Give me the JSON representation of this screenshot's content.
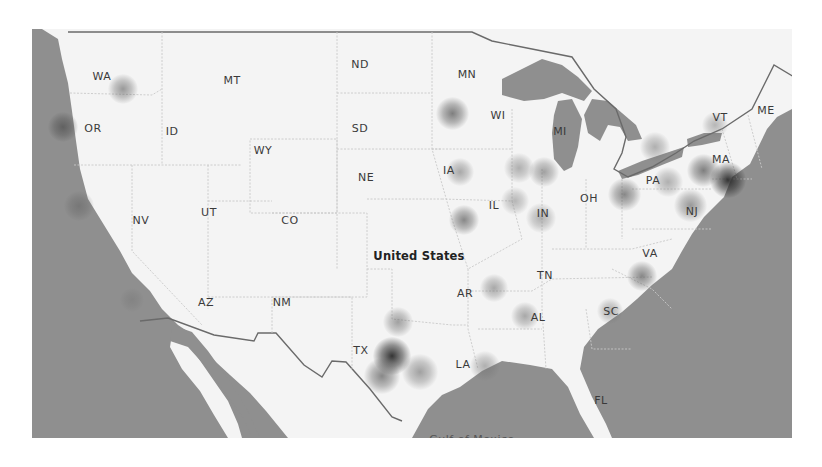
{
  "map": {
    "country_label": "United States",
    "sea_label": "Gulf of Mexico",
    "colors": {
      "water": "#8f8f8f",
      "land": "#f4f4f4",
      "border": "#6a6a6a",
      "state_line": "#c8c8c8",
      "heat_strong": "#2a2a2a",
      "heat_weak": "#9a9a9a"
    },
    "state_labels": [
      {
        "code": "WA",
        "x": 102,
        "y": 76
      },
      {
        "code": "OR",
        "x": 93,
        "y": 128
      },
      {
        "code": "ID",
        "x": 172,
        "y": 131
      },
      {
        "code": "MT",
        "x": 232,
        "y": 80
      },
      {
        "code": "WY",
        "x": 263,
        "y": 150
      },
      {
        "code": "ND",
        "x": 360,
        "y": 64
      },
      {
        "code": "SD",
        "x": 360,
        "y": 128
      },
      {
        "code": "NE",
        "x": 366,
        "y": 177
      },
      {
        "code": "NV",
        "x": 141,
        "y": 220
      },
      {
        "code": "UT",
        "x": 209,
        "y": 212
      },
      {
        "code": "CO",
        "x": 290,
        "y": 220
      },
      {
        "code": "AZ",
        "x": 206,
        "y": 302
      },
      {
        "code": "NM",
        "x": 282,
        "y": 302
      },
      {
        "code": "TX",
        "x": 361,
        "y": 350
      },
      {
        "code": "MN",
        "x": 467,
        "y": 74
      },
      {
        "code": "WI",
        "x": 498,
        "y": 115
      },
      {
        "code": "IA",
        "x": 449,
        "y": 170
      },
      {
        "code": "IL",
        "x": 494,
        "y": 205
      },
      {
        "code": "IN",
        "x": 543,
        "y": 213
      },
      {
        "code": "MI",
        "x": 560,
        "y": 131
      },
      {
        "code": "OH",
        "x": 589,
        "y": 198
      },
      {
        "code": "PA",
        "x": 653,
        "y": 180
      },
      {
        "code": "NJ",
        "x": 692,
        "y": 211
      },
      {
        "code": "VT",
        "x": 720,
        "y": 117
      },
      {
        "code": "ME",
        "x": 766,
        "y": 110
      },
      {
        "code": "MA",
        "x": 721,
        "y": 159
      },
      {
        "code": "VA",
        "x": 650,
        "y": 253
      },
      {
        "code": "TN",
        "x": 545,
        "y": 275
      },
      {
        "code": "AR",
        "x": 465,
        "y": 293
      },
      {
        "code": "AL",
        "x": 538,
        "y": 317
      },
      {
        "code": "SC",
        "x": 611,
        "y": 311
      },
      {
        "code": "LA",
        "x": 463,
        "y": 364
      },
      {
        "code": "FL",
        "x": 601,
        "y": 400
      }
    ],
    "heat_points": [
      {
        "name": "spokane",
        "x": 123,
        "y": 89,
        "r": 14,
        "intensity": 0.45
      },
      {
        "name": "portland",
        "x": 63,
        "y": 127,
        "r": 14,
        "intensity": 0.6
      },
      {
        "name": "sacramento",
        "x": 79,
        "y": 206,
        "r": 14,
        "intensity": 0.4
      },
      {
        "name": "los-angeles",
        "x": 132,
        "y": 300,
        "r": 11,
        "intensity": 0.25
      },
      {
        "name": "minneapolis",
        "x": 452,
        "y": 113,
        "r": 15,
        "intensity": 0.6
      },
      {
        "name": "des-moines",
        "x": 460,
        "y": 172,
        "r": 13,
        "intensity": 0.35
      },
      {
        "name": "st-louis",
        "x": 464,
        "y": 220,
        "r": 14,
        "intensity": 0.55
      },
      {
        "name": "chicago",
        "x": 519,
        "y": 168,
        "r": 14,
        "intensity": 0.3
      },
      {
        "name": "detroit-area",
        "x": 544,
        "y": 172,
        "r": 14,
        "intensity": 0.4
      },
      {
        "name": "springfield-il",
        "x": 515,
        "y": 201,
        "r": 13,
        "intensity": 0.25
      },
      {
        "name": "indianapolis",
        "x": 541,
        "y": 218,
        "r": 14,
        "intensity": 0.3
      },
      {
        "name": "columbus-pittsburgh",
        "x": 624,
        "y": 194,
        "r": 15,
        "intensity": 0.55
      },
      {
        "name": "harrisburg",
        "x": 668,
        "y": 182,
        "r": 14,
        "intensity": 0.3
      },
      {
        "name": "buffalo",
        "x": 655,
        "y": 147,
        "r": 14,
        "intensity": 0.3
      },
      {
        "name": "vermont",
        "x": 715,
        "y": 125,
        "r": 12,
        "intensity": 0.25
      },
      {
        "name": "hartford",
        "x": 703,
        "y": 170,
        "r": 15,
        "intensity": 0.6
      },
      {
        "name": "boston",
        "x": 728,
        "y": 180,
        "r": 16,
        "intensity": 0.95
      },
      {
        "name": "nyc-nj",
        "x": 690,
        "y": 205,
        "r": 15,
        "intensity": 0.45
      },
      {
        "name": "raleigh",
        "x": 642,
        "y": 276,
        "r": 14,
        "intensity": 0.55
      },
      {
        "name": "columbia-sc",
        "x": 610,
        "y": 311,
        "r": 12,
        "intensity": 0.3
      },
      {
        "name": "memphis",
        "x": 494,
        "y": 288,
        "r": 13,
        "intensity": 0.35
      },
      {
        "name": "birmingham",
        "x": 525,
        "y": 316,
        "r": 13,
        "intensity": 0.35
      },
      {
        "name": "dallas",
        "x": 398,
        "y": 322,
        "r": 14,
        "intensity": 0.4
      },
      {
        "name": "austin",
        "x": 392,
        "y": 356,
        "r": 17,
        "intensity": 0.95
      },
      {
        "name": "san-antonio",
        "x": 382,
        "y": 376,
        "r": 16,
        "intensity": 0.55
      },
      {
        "name": "houston",
        "x": 420,
        "y": 372,
        "r": 16,
        "intensity": 0.4
      },
      {
        "name": "new-orleans",
        "x": 485,
        "y": 366,
        "r": 14,
        "intensity": 0.3
      }
    ]
  }
}
